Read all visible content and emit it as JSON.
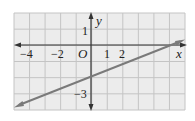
{
  "chart_data": {
    "type": "line",
    "title": "",
    "xlabel": "x",
    "ylabel": "y",
    "origin_label": "O",
    "xlim": [
      -5,
      6
    ],
    "ylim": [
      -4,
      2
    ],
    "grid": true,
    "x_tick_labels": [
      "-4",
      "-2",
      "1",
      "2"
    ],
    "y_tick_labels": [
      "1",
      "-3"
    ],
    "series": [
      {
        "name": "line",
        "equation": "y = 0.4x - 2",
        "slope": 0.4,
        "y_intercept": -2,
        "x": [
          -5,
          6
        ],
        "y": [
          -4,
          0.4
        ],
        "arrows_both_ends": true
      }
    ],
    "colors": {
      "grid_fill": "#ececec",
      "grid_line": "#c4c4c4",
      "axis": "#333333",
      "line": "#7a7a7a"
    }
  },
  "labels": {
    "x_axis": "x",
    "y_axis": "y",
    "origin": "O",
    "x_neg4": "−4",
    "x_neg2": "−2",
    "x_1": "1",
    "x_2": "2",
    "y_1": "1",
    "y_neg3": "−3"
  }
}
